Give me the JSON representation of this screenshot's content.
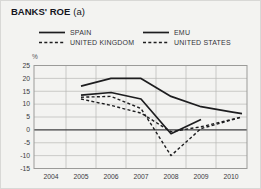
{
  "panel": {
    "title_main": "BANKS' ROE",
    "title_suffix": "(a)"
  },
  "chart_data": {
    "type": "line",
    "xlabel": "",
    "ylabel": "%",
    "ylim": [
      -15,
      25
    ],
    "y_ticks": [
      25,
      20,
      15,
      10,
      5,
      0,
      -5,
      -10,
      -15
    ],
    "x_categories": [
      "2004",
      "2005",
      "2006",
      "2007",
      "2008",
      "2009",
      "2010"
    ],
    "grid": true,
    "legend_position": "top",
    "series": [
      {
        "name": "SPAIN",
        "style": "solid",
        "color": "#1d1d1f",
        "x": [
          2005,
          2006,
          2007,
          2008,
          2009,
          2010
        ],
        "values": [
          17,
          20,
          20,
          13,
          9,
          7
        ]
      },
      {
        "name": "EMU",
        "style": "solid",
        "color": "#1d1d1f",
        "x": [
          2005,
          2006,
          2007,
          2008,
          2009
        ],
        "values": [
          13.5,
          14.5,
          12,
          -1.5,
          4
        ]
      },
      {
        "name": "UNITED KINGDOM",
        "style": "dashed",
        "color": "#1d1d1f",
        "x": [
          2005,
          2006,
          2007,
          2008,
          2009,
          2010
        ],
        "values": [
          12.7,
          13,
          8.3,
          -10,
          0.5,
          3.8
        ]
      },
      {
        "name": "UNITED STATES",
        "style": "dashed",
        "color": "#1d1d1f",
        "x": [
          2005,
          2006,
          2007,
          2008,
          2009,
          2010
        ],
        "values": [
          12,
          9.5,
          6.5,
          -0.7,
          1.2,
          4
        ]
      }
    ]
  },
  "colors": {
    "background": "#f3f3f1",
    "grid": "#b7b7b5",
    "zero_line": "#3f3f41",
    "frame": "#9b9b99",
    "tick_text": "#3a3a3e",
    "line": "#1d1d1f"
  }
}
